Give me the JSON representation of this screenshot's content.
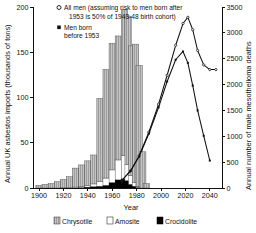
{
  "chart_data": {
    "type": "bar",
    "title": "",
    "xlabel": "Year",
    "ylabel": "Annual UK asbestos imports (thousands of tons)",
    "ylabel_right": "Annual number of male mesothelioma deaths",
    "xlim": [
      1895,
      2050
    ],
    "ylim": [
      0,
      200
    ],
    "ylim_right": [
      0,
      3500
    ],
    "xticks": [
      1900,
      1920,
      1940,
      1960,
      1980,
      2000,
      2020,
      2040
    ],
    "xticklabels": [
      "1900",
      "1920",
      "1940",
      "1960",
      "1980",
      "2000",
      "2020",
      "2040"
    ],
    "yticks": [
      0,
      50,
      100,
      150,
      200
    ],
    "yticklabels": [
      "0",
      "50",
      "100",
      "150",
      "200"
    ],
    "yticks_right": [
      0,
      500,
      1000,
      1500,
      2000,
      2500,
      3000,
      3500
    ],
    "yticklabels_right": [
      "0",
      "500",
      "1000",
      "1500",
      "2000",
      "2500",
      "3000",
      "3500"
    ],
    "grid": false,
    "legend_position": "top-left and bottom-center",
    "bar_categories": [
      1900,
      1905,
      1910,
      1915,
      1920,
      1925,
      1930,
      1935,
      1940,
      1945,
      1950,
      1955,
      1960,
      1965,
      1970,
      1973,
      1976,
      1979,
      1982,
      1985,
      1988
    ],
    "bar_series": [
      {
        "name": "Crocidolite",
        "color": "#000000",
        "values": [
          0,
          0,
          0,
          0,
          0,
          0,
          0,
          0.5,
          1,
          1.5,
          2,
          3,
          6,
          9,
          10,
          8,
          4,
          2,
          0.5,
          0,
          0
        ]
      },
      {
        "name": "Amosite",
        "color": "#ffffff",
        "values": [
          0,
          0,
          0,
          0,
          0.5,
          0.5,
          1,
          1,
          2,
          3,
          5,
          8,
          14,
          22,
          26,
          18,
          10,
          4,
          1,
          0,
          0
        ]
      },
      {
        "name": "Chrysotile",
        "color": "#b9b9b9",
        "values": [
          3,
          4,
          5,
          7,
          9,
          12,
          21,
          24,
          27,
          32,
          92,
          120,
          140,
          137,
          161,
          164,
          143,
          153,
          134,
          40,
          5
        ]
      }
    ],
    "bar_totals": [
      3,
      4,
      5,
      7,
      9.5,
      12.5,
      22,
      25.5,
      30,
      36.5,
      99,
      131,
      160,
      168,
      197,
      190,
      157,
      159,
      135.5,
      40,
      5
    ],
    "line_series": [
      {
        "name": "All men (assuming risk to men born after 1953 is 50% of 1943-48 birth cohort)",
        "marker": "open-circle",
        "color": "#111111",
        "x": [
          1968,
          1975,
          1982,
          1990,
          1998,
          2005,
          2012,
          2018,
          2022,
          2026,
          2030,
          2035,
          2040,
          2045
        ],
        "y": [
          150,
          330,
          620,
          1080,
          1620,
          2180,
          2760,
          3180,
          3300,
          3060,
          2660,
          2380,
          2290,
          2290
        ]
      },
      {
        "name": "Men born before 1953",
        "marker": "filled-square",
        "color": "#111111",
        "x": [
          1968,
          1975,
          1982,
          1990,
          1998,
          2005,
          2012,
          2018,
          2022,
          2026,
          2030,
          2035,
          2040
        ],
        "y": [
          150,
          330,
          610,
          1050,
          1560,
          2060,
          2480,
          2640,
          2420,
          1980,
          1500,
          1010,
          530
        ]
      }
    ]
  },
  "legend_top": {
    "items": [
      {
        "marker": "open-circle",
        "label_line1": "All men (assuming risk to men born after",
        "label_line2": "1953 is 50% of 1943-48 birth cohort)"
      },
      {
        "marker": "filled-square",
        "label_line1": "Men born",
        "label_line2": "before 1953"
      }
    ]
  },
  "legend_bottom": {
    "items": [
      {
        "label": "Chrysotile",
        "swatch": "hatched-grey"
      },
      {
        "label": "Amosite",
        "swatch": "white"
      },
      {
        "label": "Crocidolite",
        "swatch": "black"
      }
    ]
  },
  "axes": {
    "left_title": "Annual UK asbestos imports (thousands of tons)",
    "right_title": "Annual number of male mesothelioma deaths",
    "x_title": "Year"
  }
}
